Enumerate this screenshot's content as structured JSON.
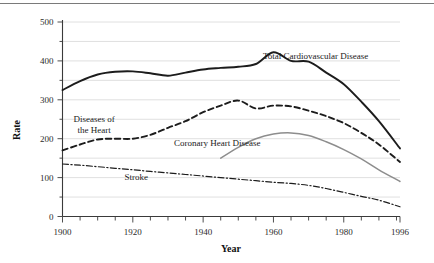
{
  "figure": {
    "name": "cardiovascular-mortality-trends",
    "top_rule": true
  },
  "chart_data": {
    "type": "line",
    "title": "",
    "xlabel": "Year",
    "ylabel": "Rate",
    "xlim": [
      1900,
      1996
    ],
    "ylim": [
      0,
      500
    ],
    "grid": true,
    "grid_axis": "y",
    "legend_position": "inline-annotations",
    "xticks": [
      1900,
      1920,
      1940,
      1960,
      1980,
      1996
    ],
    "xtick_labels": [
      "1900",
      "1920",
      "1940",
      "1960",
      "1980",
      "1996"
    ],
    "xminor_step": 5,
    "yticks": [
      0,
      100,
      200,
      300,
      400,
      500
    ],
    "ytick_labels": [
      "0",
      "100",
      "200",
      "300",
      "400",
      "500"
    ],
    "yminor_step": 50,
    "x": [
      1900,
      1905,
      1910,
      1915,
      1920,
      1925,
      1930,
      1935,
      1940,
      1945,
      1950,
      1955,
      1960,
      1965,
      1970,
      1975,
      1980,
      1985,
      1990,
      1996
    ],
    "series": [
      {
        "name": "Total Cardiovascular Disease",
        "style": "solid",
        "color": "#1c1c1c",
        "label": "Total Cardiovascular Disease",
        "label_x": 1957,
        "label_y": 405,
        "values": [
          325,
          348,
          365,
          372,
          373,
          368,
          362,
          370,
          378,
          382,
          385,
          392,
          422,
          400,
          398,
          370,
          340,
          295,
          245,
          175
        ]
      },
      {
        "name": "Diseases of the Heart",
        "style": "dashed",
        "color": "#1c1c1c",
        "label": "Diseases of\nthe Heart",
        "label_x": 1909,
        "label_y": 243,
        "values": [
          170,
          185,
          198,
          200,
          200,
          210,
          228,
          245,
          268,
          285,
          298,
          278,
          285,
          283,
          272,
          258,
          240,
          215,
          185,
          140
        ]
      },
      {
        "name": "Coronary Heart Disease",
        "style": "solid",
        "color": "#8d8d8d",
        "label": "Coronary Heart Disease",
        "label_x": 1944,
        "label_y": 182,
        "values": [
          null,
          null,
          null,
          null,
          null,
          null,
          null,
          null,
          null,
          150,
          178,
          200,
          212,
          215,
          208,
          192,
          172,
          148,
          120,
          90
        ]
      },
      {
        "name": "Stroke",
        "style": "dash-dot",
        "color": "#1c1c1c",
        "label": "Stroke",
        "label_x": 1921,
        "label_y": 95,
        "values": [
          135,
          132,
          128,
          124,
          120,
          116,
          112,
          108,
          104,
          100,
          96,
          92,
          88,
          85,
          80,
          72,
          62,
          52,
          42,
          25
        ]
      }
    ]
  },
  "labels": {
    "y_axis_title": "Rate",
    "x_axis_title": "Year",
    "total_cvd": "Total Cardiovascular Disease",
    "heart_line1": "Diseases of",
    "heart_line2": "the Heart",
    "coronary": "Coronary Heart Disease",
    "stroke": "Stroke"
  },
  "ytick_texts": [
    "500",
    "400",
    "300",
    "200",
    "100",
    "0"
  ],
  "xtick_texts": [
    "1900",
    "1920",
    "1940",
    "1960",
    "1980",
    "1996"
  ],
  "colors": {
    "total_cvd": "#1c1c1c",
    "diseases_of_heart": "#1c1c1c",
    "coronary_heart_disease": "#8d8d8d",
    "stroke": "#1c1c1c",
    "gridline": "#d8d8d8",
    "axis": "#3a3a3a"
  }
}
